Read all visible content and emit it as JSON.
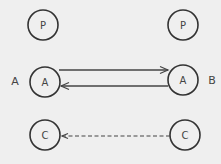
{
  "diagram": {
    "background": "#efefef",
    "stroke_color": "#333333",
    "side_labels": {
      "left": "A",
      "right": "B"
    },
    "nodes": [
      {
        "id": "p-left",
        "label": "P",
        "cx": 43,
        "cy": 25,
        "r": 15
      },
      {
        "id": "p-right",
        "label": "P",
        "cx": 183,
        "cy": 25,
        "r": 15
      },
      {
        "id": "a-left",
        "label": "A",
        "cx": 45,
        "cy": 82,
        "r": 15
      },
      {
        "id": "a-right",
        "label": "A",
        "cx": 183,
        "cy": 80,
        "r": 15
      },
      {
        "id": "c-left",
        "label": "C",
        "cx": 45,
        "cy": 135,
        "r": 15
      },
      {
        "id": "c-right",
        "label": "C",
        "cx": 185,
        "cy": 135,
        "r": 15
      }
    ],
    "edges": [
      {
        "from": "a-left",
        "to": "a-right",
        "style": "solid",
        "direction": "right"
      },
      {
        "from": "a-right",
        "to": "a-left",
        "style": "solid",
        "direction": "left"
      },
      {
        "from": "c-right",
        "to": "c-left",
        "style": "dashed",
        "direction": "left"
      }
    ]
  }
}
